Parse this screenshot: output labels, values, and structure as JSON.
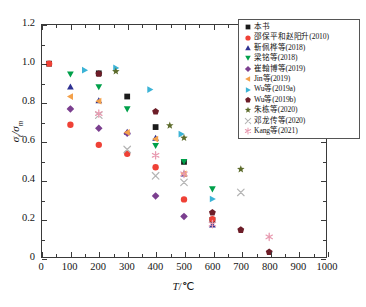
{
  "chart_data": {
    "type": "scatter",
    "title": "",
    "xlabel": "T/℃",
    "ylabel": "σt/σm",
    "xlim": [
      0,
      1000
    ],
    "ylim": [
      0,
      1.2
    ],
    "xticks": [
      0,
      100,
      200,
      300,
      400,
      500,
      600,
      700,
      800,
      900,
      1000
    ],
    "yticks": [
      0,
      0.2,
      0.4,
      0.6,
      0.8,
      1.0,
      1.2
    ],
    "xtick_labels": [
      "0",
      "100",
      "200",
      "300",
      "400",
      "500",
      "600",
      "700",
      "800",
      "900",
      "1000"
    ],
    "ytick_labels": [
      "0",
      "0.2",
      "0.4",
      "0.6",
      "0.8",
      "1.0",
      "1.2"
    ],
    "grid": false,
    "legend_position": "upper right",
    "series": [
      {
        "name": "本书",
        "marker": "square",
        "color": "#1b1b1b",
        "points": [
          [
            25,
            1.0
          ],
          [
            200,
            0.95
          ],
          [
            300,
            0.83
          ],
          [
            400,
            0.672
          ],
          [
            500,
            0.492
          ],
          [
            600,
            0.192
          ]
        ]
      },
      {
        "name": "邵保平和赵阳升(2010)",
        "marker": "circle",
        "color": "#ef4136",
        "points": [
          [
            25,
            1.0
          ],
          [
            100,
            0.684
          ],
          [
            200,
            0.58
          ],
          [
            300,
            0.534
          ],
          [
            400,
            0.464
          ],
          [
            500,
            0.298
          ],
          [
            600,
            0.196
          ]
        ]
      },
      {
        "name": "靳佩桦等(2018)",
        "marker": "triangle-up",
        "color": "#2e3192",
        "points": [
          [
            100,
            0.88
          ],
          [
            200,
            0.808
          ],
          [
            300,
            0.645
          ],
          [
            400,
            0.614
          ],
          [
            500,
            0.43
          ],
          [
            600,
            0.166
          ]
        ]
      },
      {
        "name": "梁铭等(2018)",
        "marker": "triangle-down",
        "color": "#00a04a",
        "points": [
          [
            100,
            0.946
          ],
          [
            200,
            0.88
          ],
          [
            300,
            0.766
          ],
          [
            400,
            0.576
          ],
          [
            500,
            0.494
          ],
          [
            600,
            0.352
          ]
        ]
      },
      {
        "name": "崔翰博等(2019)",
        "marker": "diamond",
        "color": "#7b3f8f",
        "points": [
          [
            100,
            0.766
          ],
          [
            200,
            0.666
          ],
          [
            300,
            0.64
          ],
          [
            400,
            0.316
          ],
          [
            500,
            0.21
          ]
        ]
      },
      {
        "name": "Jin等(2019)",
        "marker": "triangle-left",
        "color": "#f4a14a",
        "points": [
          [
            100,
            0.83
          ],
          [
            200,
            0.806
          ],
          [
            300,
            0.644
          ],
          [
            400,
            0.61
          ],
          [
            500,
            0.43
          ]
        ]
      },
      {
        "name": "Wu等(2019a)",
        "marker": "triangle-right",
        "color": "#3bb3d6",
        "points": [
          [
            150,
            0.966
          ],
          [
            260,
            0.978
          ],
          [
            380,
            0.866
          ],
          [
            490,
            0.636
          ],
          [
            600,
            0.3
          ]
        ]
      },
      {
        "name": "Wu等(2019b)",
        "marker": "pentagon",
        "color": "#6d1d28",
        "points": [
          [
            200,
            0.948
          ],
          [
            400,
            0.752
          ],
          [
            600,
            0.23
          ],
          [
            700,
            0.14
          ],
          [
            800,
            0.026
          ]
        ]
      },
      {
        "name": "朱栋等(2020)",
        "marker": "star",
        "color": "#5c6b2b",
        "points": [
          [
            260,
            0.96
          ],
          [
            450,
            0.68
          ],
          [
            500,
            0.616
          ],
          [
            700,
            0.454
          ]
        ]
      },
      {
        "name": "邓龙传等(2020)",
        "marker": "cross-x",
        "color": "#b5b5b5",
        "points": [
          [
            200,
            0.734
          ],
          [
            300,
            0.556
          ],
          [
            400,
            0.42
          ],
          [
            500,
            0.386
          ],
          [
            700,
            0.334
          ]
        ]
      },
      {
        "name": "Kang等(2021)",
        "marker": "asterisk",
        "color": "#e89ab0",
        "points": [
          [
            200,
            0.742
          ],
          [
            400,
            0.526
          ],
          [
            500,
            0.43
          ],
          [
            600,
            0.17
          ],
          [
            800,
            0.104
          ]
        ]
      }
    ]
  },
  "axes": {
    "x_title_symbol": "T",
    "x_title_unit": "/℃",
    "y_title_symbol": "σ",
    "y_title_sub1": "t",
    "y_title_sep": "/σ",
    "y_title_sub2": "m"
  }
}
